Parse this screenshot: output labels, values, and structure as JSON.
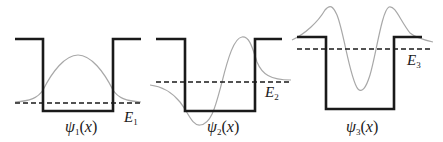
{
  "diagram": {
    "title": "",
    "panels": [
      {
        "id": "panel1",
        "state": 1,
        "psi_label": "ψ",
        "psi_sub": "1",
        "psi_arg": "(x)",
        "energy_label": "E",
        "energy_sub": "1",
        "well": {
          "x_left": 15,
          "x_wall_l": 43,
          "x_wall_r": 113,
          "x_right": 141,
          "y_top": 39,
          "y_bottom": 111
        },
        "energy_y": 103,
        "nodes": 0
      },
      {
        "id": "panel2",
        "state": 2,
        "psi_label": "ψ",
        "psi_sub": "2",
        "psi_arg": "(x)",
        "energy_label": "E",
        "energy_sub": "2",
        "well": {
          "x_left": 156,
          "x_wall_l": 185,
          "x_wall_r": 255,
          "x_right": 282,
          "y_top": 39,
          "y_bottom": 111
        },
        "energy_y": 82,
        "nodes": 1
      },
      {
        "id": "panel3",
        "state": 3,
        "psi_label": "ψ",
        "psi_sub": "3",
        "psi_arg": "(x)",
        "energy_label": "E",
        "energy_sub": "3",
        "well": {
          "x_left": 297,
          "x_wall_l": 326,
          "x_wall_r": 394,
          "x_right": 422,
          "y_top": 37,
          "y_bottom": 109
        },
        "energy_y": 49,
        "nodes": 2
      }
    ],
    "colors": {
      "well": "#1a1a1a",
      "wavefunction": "#a8a8a8",
      "energy_level": "#1a1a1a"
    }
  }
}
